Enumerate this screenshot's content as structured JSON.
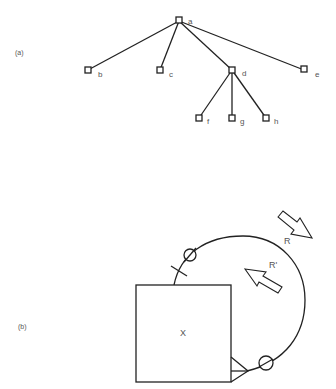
{
  "panel_a": {
    "label": "(a)",
    "nodes": {
      "a": {
        "label": "a",
        "x": 179,
        "y": 21
      },
      "b": {
        "label": "b",
        "x": 88,
        "y": 70
      },
      "c": {
        "label": "c",
        "x": 160,
        "y": 70
      },
      "d": {
        "label": "d",
        "x": 232,
        "y": 70
      },
      "e": {
        "label": "e",
        "x": 304,
        "y": 70
      },
      "f": {
        "label": "f",
        "x": 199,
        "y": 118
      },
      "g": {
        "label": "g",
        "x": 232,
        "y": 118
      },
      "h": {
        "label": "h",
        "x": 266,
        "y": 118
      }
    },
    "edges": [
      [
        "a",
        "b"
      ],
      [
        "a",
        "c"
      ],
      [
        "a",
        "d"
      ],
      [
        "a",
        "e"
      ],
      [
        "d",
        "f"
      ],
      [
        "d",
        "g"
      ],
      [
        "d",
        "h"
      ]
    ]
  },
  "panel_b": {
    "label": "(b)",
    "box_label": "X",
    "arrow_outer_label": "R",
    "arrow_inner_label": "R'"
  }
}
